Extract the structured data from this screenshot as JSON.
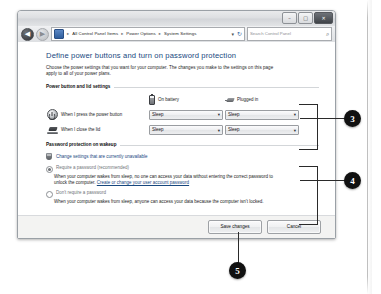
{
  "window": {
    "controls": {
      "minimize_label": "–",
      "maximize_label": "□",
      "close_label": "✕"
    },
    "nav": {
      "back_label": "◀",
      "forward_label": "▶",
      "breadcrumb": [
        "All Control Panel Items",
        "Power Options",
        "System Settings"
      ],
      "separator": "▸",
      "address_dropdown_label": "▾",
      "refresh_label": "↻"
    },
    "search": {
      "placeholder": "Search Control Panel",
      "icon_label": "⌕"
    }
  },
  "page": {
    "heading": "Define power buttons and turn on password protection",
    "intro": "Choose the power settings that you want for your computer. The changes you make to the settings on this page apply to all of your power plans."
  },
  "power_section": {
    "title": "Power button and lid settings",
    "columns": [
      {
        "label": "On battery",
        "icon": "battery-icon"
      },
      {
        "label": "Plugged in",
        "icon": "plug-icon"
      }
    ],
    "rows": [
      {
        "icon": "power-button-icon",
        "label": "When I press the power button",
        "on_battery": "Sleep",
        "plugged_in": "Sleep"
      },
      {
        "icon": "laptop-lid-icon",
        "label": "When I close the lid",
        "on_battery": "Sleep",
        "plugged_in": "Sleep"
      }
    ],
    "dropdown_arrow": "▾"
  },
  "password_section": {
    "title": "Password protection on wakeup",
    "change_settings_link": "Change settings that are currently unavailable",
    "options": [
      {
        "label": "Require a password (recommended)",
        "selected": true,
        "description": "When your computer wakes from sleep, no one can access your data without entering the correct password to unlock the computer.",
        "link_text": "Create or change your user account password"
      },
      {
        "label": "Don't require a password",
        "selected": false,
        "description": "When your computer wakes from sleep, anyone can access your data because the computer isn't locked.",
        "link_text": ""
      }
    ]
  },
  "footer": {
    "save_label": "Save changes",
    "cancel_label": "Cancel"
  },
  "callouts": [
    {
      "number": "3"
    },
    {
      "number": "4"
    },
    {
      "number": "5"
    }
  ]
}
